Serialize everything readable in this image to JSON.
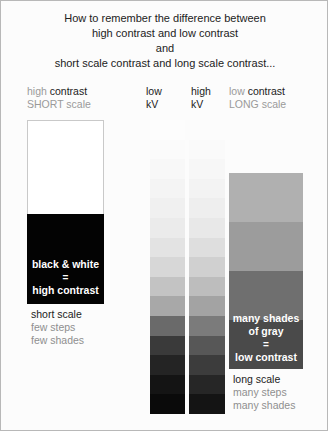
{
  "poster": {
    "heading": [
      "How to remember the difference between",
      "high contrast and low contrast",
      "and",
      "short scale contrast and long scale contrast..."
    ],
    "background_color": "#fcfcfc",
    "border_color": "#b8b8b8"
  },
  "columns": [
    {
      "id": "column-1",
      "header_line1_strong": "high",
      "header_line1_rest": " contrast",
      "header_line2": "SHORT scale",
      "caption_lines": [
        "black & white",
        "=",
        "high contrast"
      ],
      "below_strong": "short scale",
      "below_faint": [
        "few steps",
        "few shades"
      ],
      "steps": [
        "#ffffff",
        "#030303"
      ]
    },
    {
      "id": "column-2",
      "header_line1": "low",
      "header_line2": "kV",
      "steps": [
        "#fdfdfd",
        "#fbfbfb",
        "#f8f8f8",
        "#f4f4f4",
        "#f0f0f0",
        "#ebebeb",
        "#e3e3e3",
        "#d7d7d7",
        "#c3c3c3",
        "#a8a8a8",
        "#6a6a6a",
        "#3a3a3a",
        "#242424",
        "#141414",
        "#0a0a0a"
      ]
    },
    {
      "id": "column-3",
      "header_line1": "high",
      "header_line2": "kV",
      "steps": [
        "#fcfcfc",
        "#fafafa",
        "#f7f7f7",
        "#f3f3f3",
        "#eeeeee",
        "#e8e8e8",
        "#dedede",
        "#d0d0d0",
        "#bdbdbd",
        "#a3a3a3",
        "#7b7b7b",
        "#575757",
        "#3c3c3c",
        "#262626",
        "#141414"
      ]
    },
    {
      "id": "column-4",
      "header_line1_strong": "low",
      "header_line1_rest": " contrast",
      "header_line2": "LONG scale",
      "caption_lines": [
        "many shades",
        "of gray",
        "=",
        "low contrast"
      ],
      "below_strong": "long scale",
      "below_faint": [
        "many steps",
        "many shades"
      ],
      "steps": [
        "#b0b0b0",
        "#9c9c9c",
        "#6f6f6f",
        "#4a4a4a"
      ]
    }
  ],
  "colors": {
    "ink_dark": "#1b1b1b",
    "ink_gray": "#9a9a9a",
    "ink_mid": "#5e5e5e",
    "white": "#ffffff",
    "black": "#030303"
  }
}
